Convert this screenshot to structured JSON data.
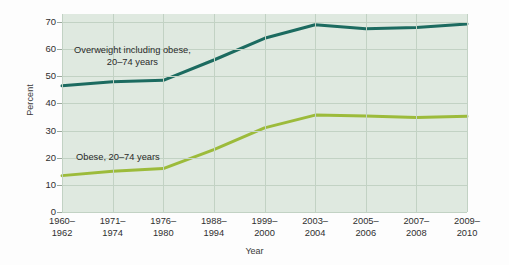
{
  "chart_data": {
    "type": "line",
    "title": "",
    "xlabel": "Year",
    "ylabel": "Percent",
    "ylim": [
      0,
      70
    ],
    "yticks": [
      0,
      10,
      20,
      30,
      40,
      50,
      60,
      70
    ],
    "ytick_labels": [
      "0",
      "10",
      "20",
      "30",
      "40",
      "50",
      "60",
      "70"
    ],
    "grid": true,
    "legend_position": "inline-annotations",
    "categories": [
      "1960–1962",
      "1971–1974",
      "1976–1980",
      "1988–1994",
      "1999–2000",
      "2003–2004",
      "2005–2006",
      "2007–2008",
      "2009–2010"
    ],
    "category_lines": [
      [
        "1960–",
        "1962"
      ],
      [
        "1971–",
        "1974"
      ],
      [
        "1976–",
        "1980"
      ],
      [
        "1988–",
        "1994"
      ],
      [
        "1999–",
        "2000"
      ],
      [
        "2003–",
        "2004"
      ],
      [
        "2005–",
        "2006"
      ],
      [
        "2007–",
        "2008"
      ],
      [
        "2009–",
        "2010"
      ]
    ],
    "series": [
      {
        "name": "Overweight including obese, 20–74 years",
        "color": "#1c6b60",
        "values": [
          46.5,
          48.0,
          48.5,
          56.0,
          64.0,
          69.0,
          67.5,
          68.0,
          69.3
        ]
      },
      {
        "name": "Obese, 20–74 years",
        "color": "#9cbb3b",
        "values": [
          13.4,
          15.0,
          16.0,
          23.0,
          31.0,
          35.7,
          35.4,
          34.8,
          35.3
        ]
      }
    ],
    "annotations": [
      {
        "id": "overweight",
        "lines": [
          "Overweight including obese,",
          "20–74 years"
        ]
      },
      {
        "id": "obese",
        "lines": [
          "Obese, 20–74 years"
        ]
      }
    ],
    "colors": {
      "plot_background": "#dfe9e0",
      "gridline": "#c2d2c4",
      "overweight_line": "#1c6b60",
      "obese_line": "#9cbb3b",
      "text": "#2f2f2f"
    }
  }
}
